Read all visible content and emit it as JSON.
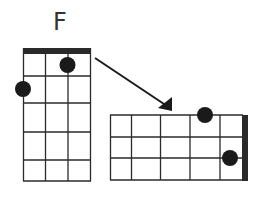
{
  "chord": {
    "name": "F",
    "instrument_strings": 4
  },
  "vertical_diagram": {
    "orientation": "vertical",
    "frets": 5,
    "dots": [
      {
        "string": 3,
        "fret": 1
      },
      {
        "string": 1,
        "fret": 2,
        "on_edge": true
      }
    ]
  },
  "horizontal_diagram": {
    "orientation": "horizontal",
    "frets": 5,
    "nut_side": "right",
    "dots": [
      {
        "string": 1,
        "fret": 1,
        "note": "top edge"
      },
      {
        "string": 3,
        "fret": 1
      }
    ]
  },
  "arrow": {
    "from": "vertical_diagram",
    "to": "horizontal_diagram"
  },
  "colors": {
    "line": "#2a2a2a",
    "dot": "#1a1a1a",
    "background": "#ffffff"
  }
}
